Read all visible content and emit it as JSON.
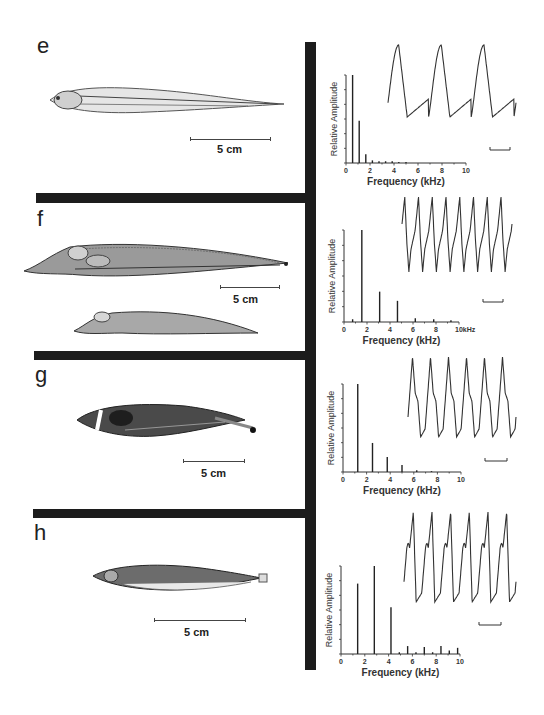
{
  "figure": {
    "panels": [
      {
        "label": "e",
        "scale_bar": "5 cm",
        "fish_count": 1
      },
      {
        "label": "f",
        "scale_bar": "5 cm",
        "fish_count": 2
      },
      {
        "label": "g",
        "scale_bar": "5 cm",
        "fish_count": 1
      },
      {
        "label": "h",
        "scale_bar": "5 cm",
        "fish_count": 1
      }
    ]
  },
  "chart_data": [
    {
      "type": "bar",
      "panel": "e",
      "title": "",
      "xlabel": "Frequency (kHz)",
      "ylabel": "Relative Amplitude",
      "xticks": [
        "0",
        "2",
        "4",
        "6",
        "8",
        "10"
      ],
      "xlim": [
        0,
        10
      ],
      "ylim": [
        0,
        1
      ],
      "x": [
        0.55,
        1.1,
        1.65,
        2.2,
        2.75,
        3.3,
        3.85,
        4.4,
        5.0
      ],
      "values": [
        1.0,
        0.48,
        0.1,
        0.03,
        0.02,
        0.02,
        0.02,
        0.01,
        0.01
      ],
      "inset_waveform": {
        "type": "line",
        "cycles": 3,
        "shape": "sinusoidal"
      },
      "grid": false
    },
    {
      "type": "bar",
      "panel": "f",
      "title": "",
      "xlabel": "Frequency (kHz)",
      "ylabel": "Relative Amplitude",
      "xticks": [
        "0",
        "2",
        "4",
        "6",
        "8",
        "10kHz"
      ],
      "xlim": [
        0,
        10
      ],
      "ylim": [
        0,
        1
      ],
      "x": [
        0.75,
        1.55,
        3.1,
        4.65,
        6.2,
        7.8,
        9.3
      ],
      "values": [
        0.03,
        1.0,
        0.33,
        0.23,
        0.04,
        0.03,
        0.02
      ],
      "inset_waveform": {
        "type": "line",
        "cycles": 8,
        "shape": "peaked"
      },
      "grid": false
    },
    {
      "type": "bar",
      "panel": "g",
      "title": "",
      "xlabel": "Frequency (kHz)",
      "ylabel": "Relative Amplitude",
      "xticks": [
        "0",
        "2",
        "4",
        "6",
        "8",
        "10"
      ],
      "xlim": [
        0,
        10
      ],
      "ylim": [
        0,
        1
      ],
      "x": [
        1.25,
        2.5,
        3.75,
        5.0,
        6.25,
        7.5
      ],
      "values": [
        1.0,
        0.33,
        0.17,
        0.08,
        0.02,
        0.01
      ],
      "inset_waveform": {
        "type": "line",
        "cycles": 6,
        "shape": "biphasic"
      },
      "grid": false
    },
    {
      "type": "bar",
      "panel": "h",
      "title": "",
      "xlabel": "Frequency (kHz)",
      "ylabel": "Relative Amplitude",
      "xticks": [
        "0",
        "2",
        "4",
        "6",
        "8",
        "10"
      ],
      "xlim": [
        0,
        10
      ],
      "ylim": [
        0,
        1
      ],
      "x": [
        1.4,
        2.8,
        4.2,
        4.9,
        5.6,
        6.3,
        7.0,
        7.7,
        8.4,
        9.1,
        9.8
      ],
      "values": [
        0.8,
        1.0,
        0.53,
        0.02,
        0.09,
        0.02,
        0.08,
        0.02,
        0.09,
        0.04,
        0.07
      ],
      "inset_waveform": {
        "type": "line",
        "cycles": 6,
        "shape": "multiphasic"
      },
      "grid": false
    }
  ]
}
